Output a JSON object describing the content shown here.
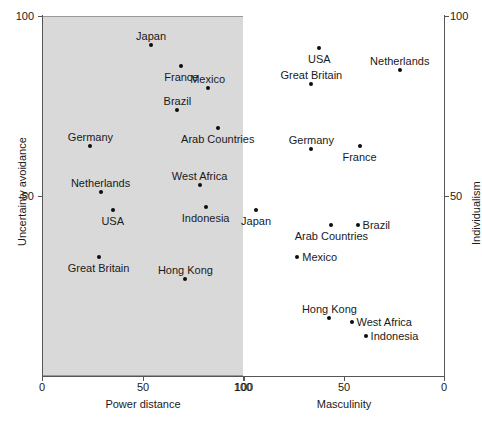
{
  "chart_data": [
    {
      "type": "scatter",
      "id": "left",
      "title": "",
      "xlabel": "Power distance",
      "ylabel": "Uncertainty avoidance",
      "xlim": [
        0,
        100
      ],
      "ylim": [
        0,
        100
      ],
      "x_ticks": [
        "0",
        "50",
        "100"
      ],
      "y_ticks": [
        "50",
        "100"
      ],
      "x_reversed": false,
      "grid": false,
      "legend": "none",
      "panel_background": "#d9d9d9",
      "points": [
        {
          "label": "Japan",
          "x": 54,
          "y": 92,
          "label_pos": "above"
        },
        {
          "label": "France",
          "x": 69,
          "y": 86,
          "label_pos": "below"
        },
        {
          "label": "Mexico",
          "x": 82,
          "y": 80,
          "label_pos": "above"
        },
        {
          "label": "Brazil",
          "x": 67,
          "y": 74,
          "label_pos": "above"
        },
        {
          "label": "Arab Countries",
          "x": 87,
          "y": 69,
          "label_pos": "below"
        },
        {
          "label": "Germany",
          "x": 24,
          "y": 64,
          "label_pos": "above"
        },
        {
          "label": "West Africa",
          "x": 78,
          "y": 53,
          "label_pos": "above"
        },
        {
          "label": "Netherlands",
          "x": 29,
          "y": 51,
          "label_pos": "above"
        },
        {
          "label": "Indonesia",
          "x": 81,
          "y": 47,
          "label_pos": "below"
        },
        {
          "label": "USA",
          "x": 35,
          "y": 46,
          "label_pos": "below"
        },
        {
          "label": "Japan",
          "x": 106,
          "y": 46,
          "label_pos": "below"
        },
        {
          "label": "Great Britain",
          "x": 28,
          "y": 33,
          "label_pos": "below"
        },
        {
          "label": "Hong Kong",
          "x": 71,
          "y": 27,
          "label_pos": "above"
        }
      ]
    },
    {
      "type": "scatter",
      "id": "right",
      "title": "",
      "xlabel": "Masculinity",
      "ylabel": "Individualism",
      "xlim": [
        100,
        0
      ],
      "ylim": [
        0,
        100
      ],
      "x_ticks": [
        "100",
        "50",
        "0"
      ],
      "y_ticks": [
        "50",
        "100"
      ],
      "x_reversed": true,
      "grid": false,
      "legend": "none",
      "panel_background": "#ffffff",
      "points": [
        {
          "label": "USA",
          "x": 62,
          "y": 91,
          "label_pos": "below"
        },
        {
          "label": "Netherlands",
          "x": 22,
          "y": 85,
          "label_pos": "above"
        },
        {
          "label": "Great Britain",
          "x": 66,
          "y": 81,
          "label_pos": "above"
        },
        {
          "label": "Germany",
          "x": 66,
          "y": 63,
          "label_pos": "above"
        },
        {
          "label": "France",
          "x": 42,
          "y": 64,
          "label_pos": "below"
        },
        {
          "label": "Brazil",
          "x": 43,
          "y": 42,
          "label_pos": "right"
        },
        {
          "label": "Arab Countries",
          "x": 56,
          "y": 42,
          "label_pos": "below"
        },
        {
          "label": "Mexico",
          "x": 73,
          "y": 33,
          "label_pos": "right"
        },
        {
          "label": "Hong Kong",
          "x": 57,
          "y": 16,
          "label_pos": "above"
        },
        {
          "label": "West Africa",
          "x": 46,
          "y": 15,
          "label_pos": "right"
        },
        {
          "label": "Indonesia",
          "x": 39,
          "y": 11,
          "label_pos": "right"
        }
      ]
    }
  ],
  "left_panel": {
    "ylabel": "Uncertainty avoidance",
    "xlabel": "Power distance",
    "y_tick_100": "100",
    "y_tick_50": "50",
    "x_tick_0": "0",
    "x_tick_50": "50",
    "x_tick_100": "100"
  },
  "right_panel": {
    "ylabel": "Individualism",
    "xlabel": "Masculinity",
    "y_tick_100": "100",
    "y_tick_50": "50",
    "x_tick_100": "100",
    "x_tick_50": "50",
    "x_tick_0": "0"
  }
}
